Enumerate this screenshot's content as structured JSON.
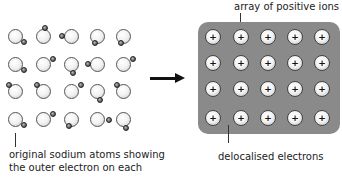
{
  "diagram": {
    "left": {
      "label_line1": "original sodium atoms showing",
      "label_line2": "the outer electron on each",
      "grid": {
        "rows": 4,
        "cols": 5
      }
    },
    "arrow": {
      "direction": "right"
    },
    "right": {
      "top_label": "array of positive ions",
      "bottom_label": "delocalised electrons",
      "ion_symbol": "+",
      "grid": {
        "rows": 4,
        "cols": 5
      },
      "background_color": "#8a8a8a"
    }
  }
}
